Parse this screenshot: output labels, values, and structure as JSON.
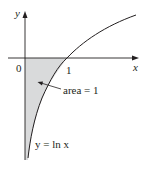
{
  "diagram": {
    "type": "graph-of-function",
    "axes": {
      "x_label": "x",
      "y_label": "y",
      "origin_label": "0",
      "tick_label_x": "1"
    },
    "curve": {
      "equation_label": "y = ln x",
      "function": "ln x"
    },
    "shaded_region": {
      "annotation": "area = 1",
      "fill_color": "#d9dadb"
    },
    "colors": {
      "line": "#231f20",
      "shade": "#d9dadb",
      "background": "#ffffff"
    }
  }
}
